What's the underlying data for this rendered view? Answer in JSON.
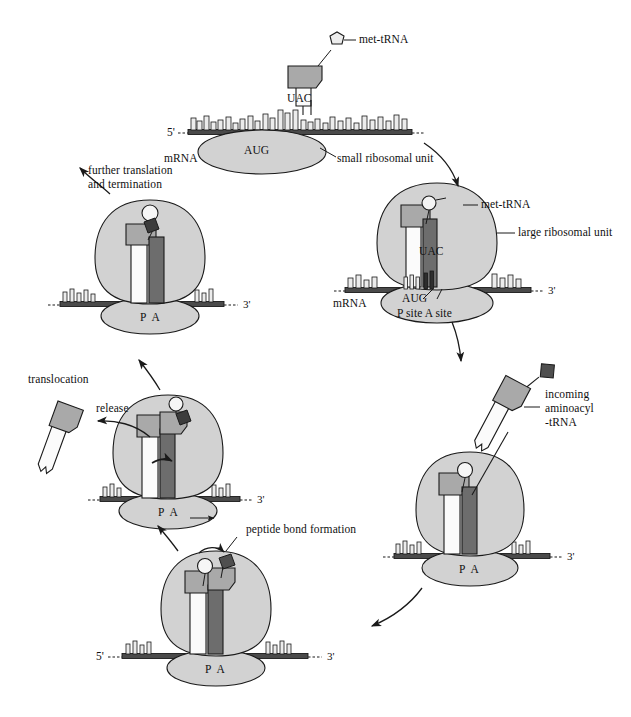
{
  "figure": {
    "type": "biology-diagram",
    "palette": {
      "ribosome_large": "#d2d2d2",
      "ribosome_small": "#d2d2d2",
      "trna_head": "#a9a9a9",
      "trna_body_white": "#fbfbfb",
      "trna_body_dark": "#6d6d6d",
      "mrna_bar": "#4a4a4a",
      "base_tick": "#ededed",
      "outline": "#1a1a1a",
      "amino_acid_dark": "#5a5a5a",
      "amino_acid_light": "#f2f2f2"
    }
  },
  "stages": [
    {
      "id": "initiation",
      "labels": {
        "met_trna": "met-tRNA",
        "anticodon": "UAC",
        "codon": "AUG",
        "mrna": "mRNA",
        "small_subunit": "small ribosomal unit",
        "five_prime": "5'",
        "three_prime": ""
      }
    },
    {
      "id": "large-subunit-joins",
      "labels": {
        "met_trna": "met-tRNA",
        "large_subunit": "large ribosomal unit",
        "anticodon": "UAC",
        "codon": "AUG",
        "mrna": "mRNA",
        "sites": "P site A site",
        "three_prime": "3'"
      }
    },
    {
      "id": "aminoacyl-trna-entry",
      "labels": {
        "incoming_line1": "incoming",
        "incoming_line2": "aminoacyl",
        "incoming_line3": "-tRNA",
        "sites": "P  A",
        "three_prime": "3'"
      }
    },
    {
      "id": "peptide-bond-formation",
      "labels": {
        "peptide_bond": "peptide bond formation",
        "sites": "P  A",
        "five_prime": "5'",
        "three_prime": "3'"
      }
    },
    {
      "id": "translocation-release",
      "labels": {
        "translocation": "translocation",
        "release": "release",
        "sites": "P  A",
        "three_prime": "3'"
      }
    },
    {
      "id": "elongation-termination",
      "labels": {
        "further": "further translation",
        "further2": "and termination",
        "sites": "P  A",
        "three_prime": "3'"
      }
    }
  ],
  "arrows": [
    {
      "name": "initiation-to-large",
      "direction": "clockwise-down-right"
    },
    {
      "name": "large-to-aminoacyl",
      "direction": "clockwise-down"
    },
    {
      "name": "aminoacyl-to-peptide",
      "direction": "clockwise-down-left"
    },
    {
      "name": "peptide-to-translocation",
      "direction": "counter-up-left"
    },
    {
      "name": "translocation-to-elongation",
      "direction": "up-left"
    },
    {
      "name": "elongation-to-start",
      "direction": "up"
    },
    {
      "name": "release-arrow",
      "direction": "left"
    }
  ]
}
